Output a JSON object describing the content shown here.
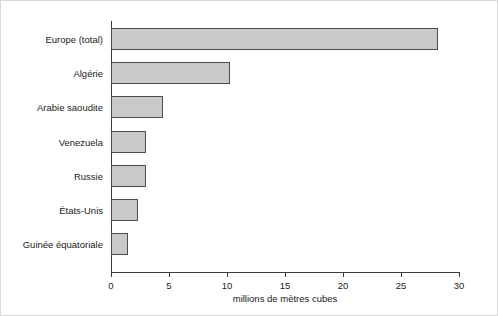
{
  "chart_data": {
    "type": "bar",
    "orientation": "horizontal",
    "title": "",
    "subtitle": "",
    "xlabel": "millions de mètres cubes",
    "ylabel": "",
    "xlim": [
      0,
      30
    ],
    "xticks": [
      0,
      5,
      10,
      15,
      20,
      25,
      30
    ],
    "xtick_labels": [
      "0",
      "5",
      "10",
      "15",
      "20",
      "25",
      "30"
    ],
    "grid": false,
    "legend": null,
    "categories": [
      "Europe (total)",
      "Algérie",
      "Arabie saoudite",
      "Venezuela",
      "Russie",
      "États-Unis",
      "Guinée équatoriale"
    ],
    "values": [
      28.2,
      10.3,
      4.5,
      3.0,
      3.0,
      2.3,
      1.5
    ],
    "bars": [
      {
        "category": "Europe (total)",
        "value": 28.2
      },
      {
        "category": "Algérie",
        "value": 10.3
      },
      {
        "category": "Arabie saoudite",
        "value": 4.5
      },
      {
        "category": "Venezuela",
        "value": 3.0
      },
      {
        "category": "Russie",
        "value": 3.0
      },
      {
        "category": "États-Unis",
        "value": 2.3
      },
      {
        "category": "Guinée équatoriale",
        "value": 1.5
      }
    ],
    "colors": {
      "bar_fill": "#c9c9c9",
      "bar_edge": "#4d4d4d",
      "axis": "#3a3a3a",
      "text": "#1a1a1a",
      "background": "#ffffff",
      "frame": "#d9d9d9"
    }
  }
}
